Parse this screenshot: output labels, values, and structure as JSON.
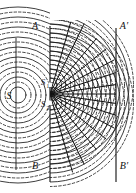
{
  "figure": {
    "background_color": "#ffffff",
    "ink_color": "#1a1a1a",
    "width": 136,
    "height": 193
  },
  "labels": {
    "source": "S",
    "slit_upper": "S",
    "slit_upper_sub": "1",
    "slit_lower": "S",
    "slit_lower_sub": "2",
    "barrier_top": "A",
    "barrier_bottom": "B",
    "screen_top": "A′",
    "screen_bottom": "B′"
  },
  "geometry": {
    "left_wall_x": 16,
    "barrier_x": 50,
    "screen_x": 116,
    "barrier_top_y": 26,
    "barrier_bottom_y": 182,
    "screen_top_y": 28,
    "screen_bottom_y": 182,
    "left_wall_top_y": 38,
    "left_wall_bottom_y": 170,
    "source_point": {
      "x": 18,
      "y": 95
    },
    "slit_upper_point": {
      "x": 50,
      "y": 85
    },
    "slit_lower_point": {
      "x": 50,
      "y": 103
    },
    "center_axis_y": 95
  },
  "waves": {
    "source_wavefront_radii_solid": [
      8,
      18,
      28,
      38,
      48,
      58,
      68,
      78,
      88
    ],
    "source_wavefront_radii_dashed": [
      13,
      23,
      33,
      43,
      53,
      63,
      73,
      83
    ],
    "slit_wavefront_radii_solid": [
      7,
      16,
      25,
      34,
      43,
      52,
      61,
      70,
      79,
      88
    ],
    "slit_wavefront_radii_dashed": [
      11.5,
      20.5,
      29.5,
      38.5,
      47.5,
      56.5,
      65.5,
      74.5,
      83.5
    ],
    "wavelength": 9,
    "solid_meaning": "crest",
    "dashed_meaning": "trough"
  },
  "nodal_lines": {
    "count": 14,
    "origin": {
      "x": 50,
      "y": 94
    },
    "angles_degrees": [
      -74,
      -62,
      -50,
      -39,
      -28,
      -18,
      -8,
      0,
      8,
      18,
      28,
      39,
      50,
      62,
      74
    ],
    "description": "radial lines of destructive interference fanning out from between the two slits"
  }
}
